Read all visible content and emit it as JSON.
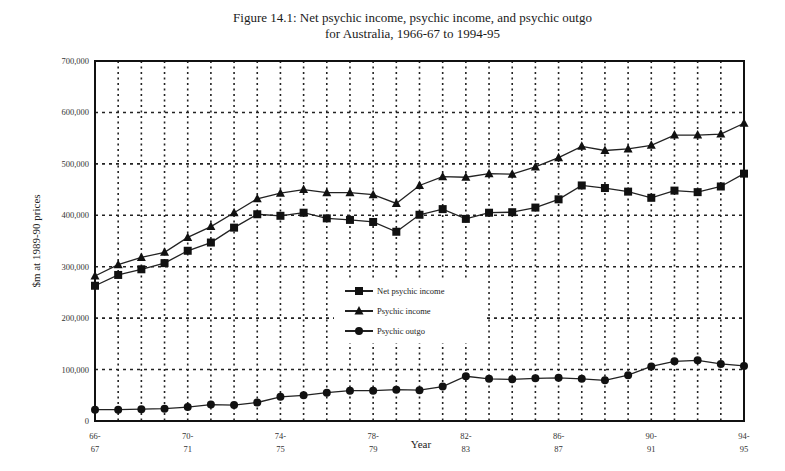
{
  "chart_data": {
    "type": "line",
    "title": "Figure 14.1: Net psychic income, psychic income, and psychic outgo",
    "subtitle": "for Australia, 1966-67 to 1994-95",
    "xlabel": "Year",
    "ylabel": "$m at 1989-90 prices",
    "ylim": [
      0,
      700000
    ],
    "yticks": [
      0,
      100000,
      200000,
      300000,
      400000,
      500000,
      600000,
      700000
    ],
    "ytick_labels": [
      "0",
      "100,000",
      "200,000",
      "300,000",
      "400,000",
      "500,000",
      "600,000",
      "700,000"
    ],
    "grid": true,
    "legend_position": "center-left inside plot",
    "x": [
      "66-67",
      "67-68",
      "68-69",
      "69-70",
      "70-71",
      "71-72",
      "72-73",
      "73-74",
      "74-75",
      "75-76",
      "76-77",
      "77-78",
      "78-79",
      "79-80",
      "80-81",
      "81-82",
      "82-83",
      "83-84",
      "84-85",
      "85-86",
      "86-87",
      "87-88",
      "88-89",
      "89-90",
      "90-91",
      "91-92",
      "92-93",
      "93-94",
      "94-95"
    ],
    "xtick_labels": [
      {
        "index": 0,
        "line1": "66-",
        "line2": "67"
      },
      {
        "index": 4,
        "line1": "70-",
        "line2": "71"
      },
      {
        "index": 8,
        "line1": "74-",
        "line2": "75"
      },
      {
        "index": 12,
        "line1": "78-",
        "line2": "79"
      },
      {
        "index": 16,
        "line1": "82-",
        "line2": "83"
      },
      {
        "index": 20,
        "line1": "86-",
        "line2": "87"
      },
      {
        "index": 24,
        "line1": "90-",
        "line2": "91"
      },
      {
        "index": 28,
        "line1": "94-",
        "line2": "95"
      }
    ],
    "series": [
      {
        "name": "Net psychic income",
        "marker": "square",
        "values": [
          263000,
          284000,
          295000,
          307000,
          331000,
          347000,
          376000,
          402000,
          399000,
          405000,
          394000,
          391000,
          387000,
          368000,
          401000,
          412000,
          393000,
          405000,
          406000,
          415000,
          431000,
          458000,
          453000,
          446000,
          434000,
          448000,
          445000,
          456000,
          481000
        ]
      },
      {
        "name": "Psychic income",
        "marker": "triangle",
        "values": [
          282000,
          304000,
          318000,
          328000,
          357000,
          378000,
          405000,
          432000,
          443000,
          450000,
          444000,
          444000,
          440000,
          423000,
          458000,
          475000,
          474000,
          481000,
          480000,
          494000,
          512000,
          534000,
          526000,
          529000,
          536000,
          556000,
          556000,
          558000,
          579000
        ]
      },
      {
        "name": "Psychic outgo",
        "marker": "circle",
        "values": [
          22000,
          22000,
          23000,
          24000,
          27000,
          32000,
          31000,
          36000,
          47000,
          50000,
          55000,
          59000,
          59000,
          61000,
          60000,
          67000,
          87000,
          82000,
          81000,
          83000,
          84000,
          82000,
          79000,
          89000,
          106000,
          116000,
          118000,
          111000,
          107000
        ]
      }
    ]
  }
}
